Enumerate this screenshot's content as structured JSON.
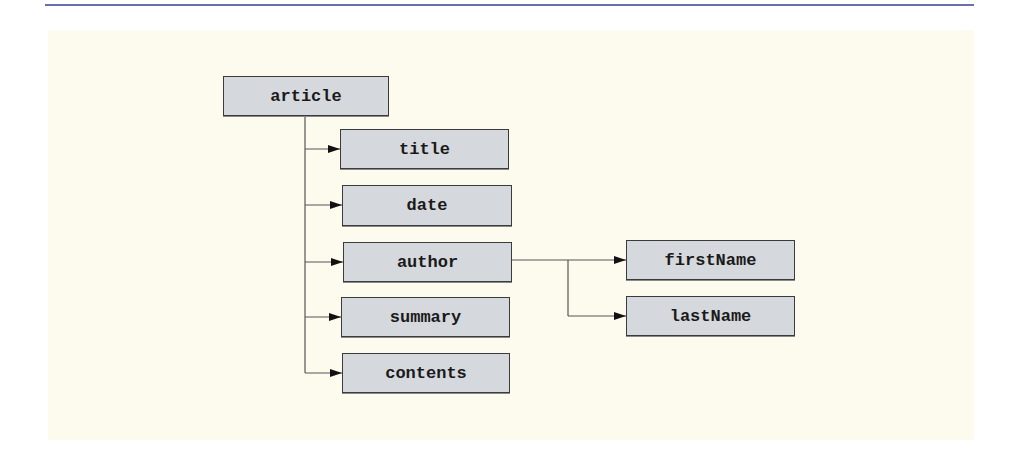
{
  "diagram": {
    "type": "tree",
    "colors": {
      "top_rule": "#6a6fb0",
      "panel_background": "#fdfbee",
      "node_fill": "#d5d8dd",
      "node_border": "#3b3b3b",
      "connector": "#555555",
      "arrowhead": "#111111"
    },
    "root": {
      "label": "article"
    },
    "children": [
      {
        "label": "title"
      },
      {
        "label": "date"
      },
      {
        "label": "author",
        "children": [
          {
            "label": "firstName"
          },
          {
            "label": "lastName"
          }
        ]
      },
      {
        "label": "summary"
      },
      {
        "label": "contents"
      }
    ],
    "nodes": {
      "article": "article",
      "title": "title",
      "date": "date",
      "author": "author",
      "summary": "summary",
      "contents": "contents",
      "firstName": "firstName",
      "lastName": "lastName"
    }
  }
}
